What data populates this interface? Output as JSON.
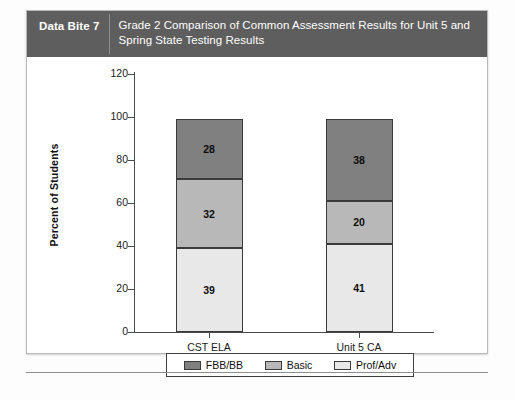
{
  "header": {
    "tag": "Data Bite 7",
    "title": "Grade 2 Comparison of Common Assessment Results for Unit 5 and Spring State Testing Results"
  },
  "colors": {
    "header_band": "#5e5e5e",
    "fbb_bb": "#808080",
    "basic": "#b8b8b8",
    "prof_adv": "#e8e8e8",
    "axis": "#4a4a4a",
    "bar_outline": "#3a3a3a"
  },
  "chart_data": {
    "type": "bar",
    "subtype": "stacked-vertical",
    "title": "Grade 2 Comparison of Common Assessment Results for Unit 5 and Spring State Testing Results",
    "xlabel": "",
    "ylabel": "Percent of Students",
    "ylim": [
      0,
      120
    ],
    "ytick_step": 20,
    "yticks": [
      0,
      20,
      40,
      60,
      80,
      100,
      120
    ],
    "ytick_labels": [
      "0",
      "20",
      "40",
      "60",
      "80",
      "100",
      "120"
    ],
    "grid": false,
    "legend_position": "bottom",
    "categories": [
      "CST ELA",
      "Unit 5 CA"
    ],
    "stack_order_bottom_to_top": [
      "Prof/Adv",
      "Basic",
      "FBB/BB"
    ],
    "series": [
      {
        "name": "Prof/Adv",
        "color": "#e8e8e8",
        "values": [
          39,
          41
        ]
      },
      {
        "name": "Basic",
        "color": "#b8b8b8",
        "values": [
          32,
          20
        ]
      },
      {
        "name": "FBB/BB",
        "color": "#808080",
        "values": [
          28,
          38
        ]
      }
    ],
    "totals": [
      99,
      99
    ],
    "legend": [
      {
        "label": "FBB/BB",
        "color": "#808080"
      },
      {
        "label": "Basic",
        "color": "#b8b8b8"
      },
      {
        "label": "Prof/Adv",
        "color": "#e8e8e8"
      }
    ]
  }
}
